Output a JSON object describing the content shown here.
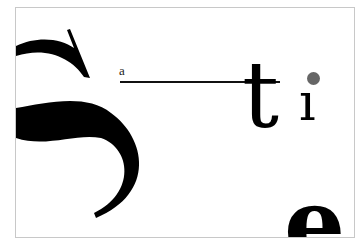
{
  "artwork": {
    "letters": {
      "large_s": "S",
      "small_a": "a",
      "t": "t",
      "i": "ı",
      "e": "e"
    },
    "colors": {
      "ink": "#000000",
      "dot": "#666666",
      "frame_border": "#c8c8c8",
      "background": "#ffffff"
    }
  }
}
